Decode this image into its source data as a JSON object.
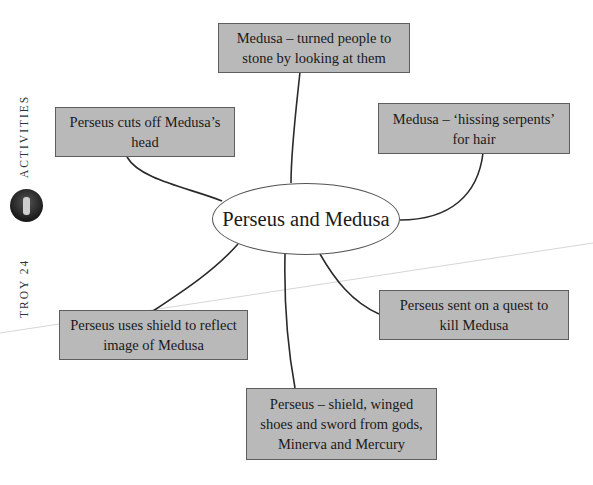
{
  "sidebar": {
    "series_label": "TROY 24",
    "section_label": "ACTIVITIES",
    "logo_icon": "troy-emblem-icon"
  },
  "mindmap": {
    "central_topic": "Perseus and Medusa",
    "nodes": [
      {
        "id": "top",
        "lines": [
          "Medusa – turned people to",
          "stone by looking at them"
        ]
      },
      {
        "id": "top-left",
        "lines": [
          "Perseus cuts off Medusa’s",
          "head"
        ]
      },
      {
        "id": "top-right",
        "lines": [
          "Medusa – ‘hissing serpents’",
          "for hair"
        ]
      },
      {
        "id": "right",
        "lines": [
          "Perseus sent on a quest to",
          "kill Medusa"
        ]
      },
      {
        "id": "left",
        "lines": [
          "Perseus uses shield to reflect",
          "image of Medusa"
        ]
      },
      {
        "id": "bottom",
        "lines": [
          "Perseus – shield, winged",
          "shoes and sword from gods,",
          "Minerva and Mercury"
        ]
      }
    ]
  },
  "colors": {
    "box_fill": "#b9b9b9",
    "box_border": "#5e5e5e",
    "connector": "#2a2a2a",
    "background": "#ffffff"
  }
}
